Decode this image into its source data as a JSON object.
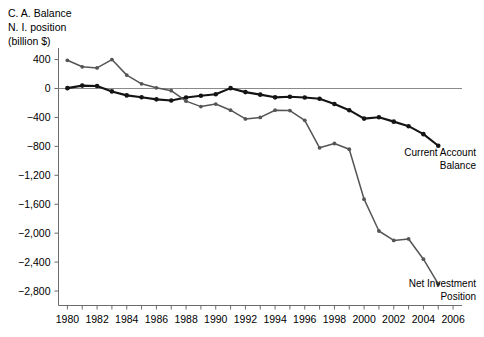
{
  "chart_data": {
    "type": "line",
    "title": "",
    "ylabel_lines": [
      "C. A. Balance",
      "N. I. position",
      "(billion $)"
    ],
    "xlabel": "",
    "xlim": [
      1979.4,
      2006.6
    ],
    "ylim": [
      -3000,
      560
    ],
    "yticks": [
      400,
      0,
      -400,
      -800,
      -1200,
      -1600,
      -2000,
      -2400,
      -2800
    ],
    "ytick_labels": [
      "400",
      "0",
      "−400",
      "−800",
      "−1,200",
      "−1,600",
      "−2,000",
      "−2,400",
      "−2,800"
    ],
    "xticks": [
      1980,
      1981,
      1982,
      1983,
      1984,
      1985,
      1986,
      1987,
      1988,
      1989,
      1990,
      1991,
      1992,
      1993,
      1994,
      1995,
      1996,
      1997,
      1998,
      1999,
      2000,
      2001,
      2002,
      2003,
      2004,
      2005,
      2006
    ],
    "xtick_labels_shown": [
      "1980",
      "1982",
      "1984",
      "1986",
      "1988",
      "1990",
      "1992",
      "1994",
      "1996",
      "1998",
      "2000",
      "2002",
      "2004",
      "2006"
    ],
    "grid": false,
    "zero_line": true,
    "legend_position": "inline-annotations",
    "x": [
      1980,
      1981,
      1982,
      1983,
      1984,
      1985,
      1986,
      1987,
      1988,
      1989,
      1990,
      1991,
      1992,
      1993,
      1994,
      1995,
      1996,
      1997,
      1998,
      1999,
      2000,
      2001,
      2002,
      2003,
      2004,
      2005
    ],
    "series": [
      {
        "name": "Current Account Balance",
        "color": "#141414",
        "marker": "circle",
        "label_lines": [
          "Current Account",
          "Balance"
        ],
        "values": [
          5,
          40,
          35,
          -40,
          -95,
          -120,
          -150,
          -165,
          -125,
          -100,
          -80,
          5,
          -50,
          -85,
          -122,
          -114,
          -125,
          -141,
          -214,
          -300,
          -416,
          -397,
          -458,
          -521,
          -631,
          -792
        ]
      },
      {
        "name": "Net Investment Position",
        "color": "#555555",
        "marker": "circle",
        "label_lines": [
          "Net Investment",
          "Position"
        ],
        "values": [
          390,
          300,
          285,
          400,
          185,
          65,
          10,
          -30,
          -175,
          -250,
          -215,
          -300,
          -420,
          -400,
          -300,
          -305,
          -440,
          -820,
          -760,
          -840,
          -1530,
          -1970,
          -2100,
          -2080,
          -2360,
          -2700
        ]
      }
    ]
  }
}
